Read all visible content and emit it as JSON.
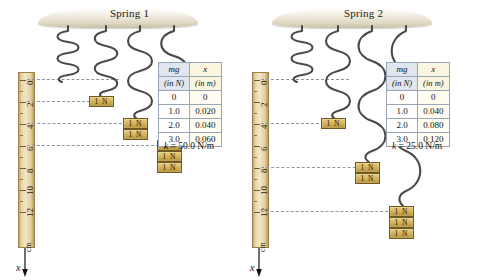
{
  "figure": {
    "caption": "Hooke's law comparison of two springs with different spring constants"
  },
  "panels": [
    {
      "id": "spring-1",
      "title": "Spring 1",
      "k_label": "k = 50.0 N/m",
      "k_symbol": "k",
      "k_value": "= 50.0 N/m",
      "ruler": {
        "unit": "cm",
        "axis_label": "x",
        "ticks": [
          "0",
          "2",
          "4",
          "6",
          "8",
          "10",
          "12"
        ]
      },
      "table": {
        "header_force": "mg",
        "header_force_unit": "(in N)",
        "header_disp": "x",
        "header_disp_unit": "(in m)",
        "rows": [
          {
            "mg": "0",
            "x": "0"
          },
          {
            "mg": "1.0",
            "x": "0.020"
          },
          {
            "mg": "2.0",
            "x": "0.040"
          },
          {
            "mg": "3.0",
            "x": "0.060"
          }
        ]
      },
      "springs": [
        {
          "weights": 0,
          "stretch_cm": 0,
          "label": ""
        },
        {
          "weights": 1,
          "stretch_cm": 2,
          "label": "1 N"
        },
        {
          "weights": 2,
          "stretch_cm": 4,
          "label": "1 N"
        },
        {
          "weights": 3,
          "stretch_cm": 6,
          "label": "1 N"
        }
      ],
      "weight_label": "1 N"
    },
    {
      "id": "spring-2",
      "title": "Spring 2",
      "k_label": "k = 25.0 N/m",
      "k_symbol": "k",
      "k_value": "= 25.0 N/m",
      "ruler": {
        "unit": "cm",
        "axis_label": "x",
        "ticks": [
          "0",
          "2",
          "4",
          "6",
          "8",
          "10",
          "12"
        ]
      },
      "table": {
        "header_force": "mg",
        "header_force_unit": "(in N)",
        "header_disp": "x",
        "header_disp_unit": "(in m)",
        "rows": [
          {
            "mg": "0",
            "x": "0"
          },
          {
            "mg": "1.0",
            "x": "0.040"
          },
          {
            "mg": "2.0",
            "x": "0.080"
          },
          {
            "mg": "3.0",
            "x": "0.120"
          }
        ]
      },
      "springs": [
        {
          "weights": 0,
          "stretch_cm": 0,
          "label": ""
        },
        {
          "weights": 1,
          "stretch_cm": 4,
          "label": "1 N"
        },
        {
          "weights": 2,
          "stretch_cm": 8,
          "label": "1 N"
        },
        {
          "weights": 3,
          "stretch_cm": 12,
          "label": "1 N"
        }
      ],
      "weight_label": "1 N"
    }
  ],
  "chart_data": {
    "type": "line",
    "xlabel": "mg (in N)",
    "ylabel": "x (in m)",
    "x": [
      0,
      1.0,
      2.0,
      3.0
    ],
    "series": [
      {
        "name": "Spring 1 (k = 50.0 N/m)",
        "values": [
          0,
          0.02,
          0.04,
          0.06
        ]
      },
      {
        "name": "Spring 2 (k = 25.0 N/m)",
        "values": [
          0,
          0.04,
          0.08,
          0.12
        ]
      }
    ],
    "legend": "right",
    "grid": false
  },
  "colors": {
    "ruler_wood": "#e3d0a2",
    "weight_gold": "#d9bb63",
    "spring_gray": "#4a4a4a",
    "dashed_guide": "#8a95a5",
    "table_header_blue": "#dfe6ef",
    "table_header_cream": "#fbf6e0"
  }
}
